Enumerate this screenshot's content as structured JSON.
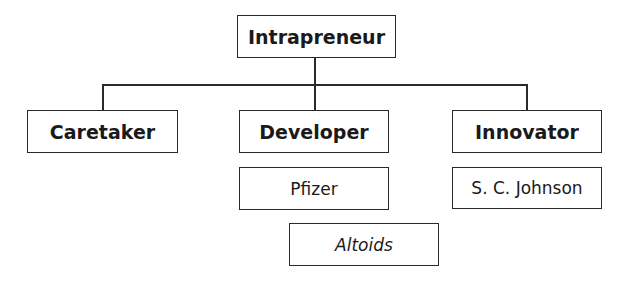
{
  "diagram": {
    "type": "hierarchy",
    "root": {
      "label": "Intrapreneur"
    },
    "children": [
      {
        "label": "Caretaker",
        "examples": []
      },
      {
        "label": "Developer",
        "examples": [
          "Pfizer",
          "Altoids"
        ]
      },
      {
        "label": "Innovator",
        "examples": [
          "S. C. Johnson"
        ]
      }
    ]
  },
  "nodes": {
    "root": "Intrapreneur",
    "caretaker": "Caretaker",
    "developer": "Developer",
    "innovator": "Innovator",
    "pfizer": "Pfizer",
    "altoids": "Altoids",
    "scjohnson": "S. C. Johnson"
  }
}
